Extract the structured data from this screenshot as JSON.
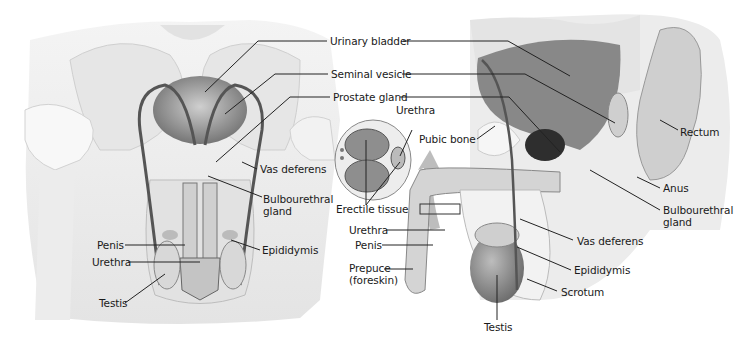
{
  "figure": {
    "front_view": {
      "labels": {
        "urinary_bladder": "Urinary bladder",
        "seminal_vesicle": "Seminal vesicle",
        "prostate_gland": "Prostate gland",
        "vas_deferens": "Vas deferens",
        "bulbourethral_gland": "Bulbourethral\ngland",
        "penis": "Penis",
        "urethra": "Urethra",
        "epididymis": "Epididymis",
        "testis": "Testis"
      }
    },
    "cross_section": {
      "labels": {
        "urethra": "Urethra",
        "erectile_tissue": "Erectile tissue"
      }
    },
    "side_view": {
      "labels": {
        "pubic_bone": "Pubic bone",
        "rectum": "Rectum",
        "anus": "Anus",
        "bulbourethral_gland": "Bulbourethral\ngland",
        "urethra": "Urethra",
        "penis": "Penis",
        "prepuce": "Prepuce\n(foreskin)",
        "vas_deferens": "Vas deferens",
        "epididymis": "Epididymis",
        "scrotum": "Scrotum",
        "testis": "Testis"
      }
    },
    "colors": {
      "background": "#ffffff",
      "body_light": "#eeeeee",
      "body_mid": "#d6d6d6",
      "organ_dark": "#7a7a7a",
      "prostate": "#2e2e2e",
      "leader_line": "#222222",
      "text": "#1a1a1a"
    }
  }
}
